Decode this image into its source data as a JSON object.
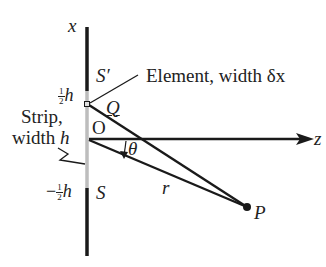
{
  "diagram": {
    "type": "single-slit diffraction geometry",
    "colors": {
      "ink": "#1a1a1a",
      "strip": "#bdbdbd",
      "background": "#ffffff"
    },
    "axes": {
      "vertical_label": "x",
      "horizontal_label": "z"
    },
    "labels": {
      "s_prime": "S′",
      "s": "S",
      "q": "Q",
      "o": "O",
      "theta": "θ",
      "r": "r",
      "p": "P",
      "half_h_num": "1",
      "half_h_den": "2",
      "half_h_var": "h",
      "neg_half_h_sign": "−",
      "neg_half_h_num": "1",
      "neg_half_h_den": "2",
      "neg_half_h_var": "h",
      "element_label": "Element, width δx",
      "strip_line1": "Strip,",
      "strip_line2_prefix": "width ",
      "strip_line2_var": "h"
    },
    "geometry": {
      "screen_x": 87,
      "screen_top": 27,
      "strip_top": 90,
      "strip_bottom": 188,
      "screen_bottom": 256,
      "origin": [
        87,
        138
      ],
      "element": [
        87,
        104
      ],
      "point_P": [
        247,
        207
      ],
      "z_axis_end": 314
    }
  }
}
